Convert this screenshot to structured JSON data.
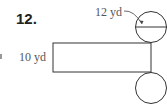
{
  "problem": {
    "number": "12.",
    "labels": {
      "diameter": "12 yd",
      "height": "10 yd"
    },
    "shape": "cylinder-net"
  }
}
